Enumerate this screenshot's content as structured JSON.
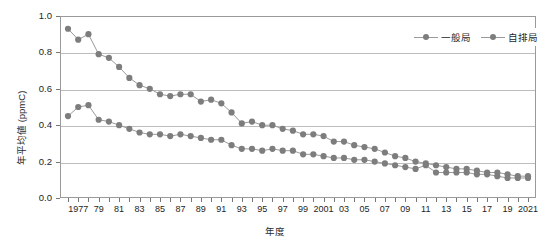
{
  "chart_data": {
    "type": "line",
    "title": "",
    "xlabel": "年度",
    "ylabel": "年平均値 (ppmC)",
    "ylim": [
      0.0,
      1.0
    ],
    "ytick_labels": [
      "0.0",
      "0.2",
      "0.4",
      "0.6",
      "0.8",
      "1.0"
    ],
    "ytick_values": [
      0.0,
      0.2,
      0.4,
      0.6,
      0.8,
      1.0
    ],
    "grid": true,
    "legend_position": "top-right",
    "x": [
      1976,
      1977,
      1978,
      1979,
      1980,
      1981,
      1982,
      1983,
      1984,
      1985,
      1986,
      1987,
      1988,
      1989,
      1990,
      1991,
      1992,
      1993,
      1994,
      1995,
      1996,
      1997,
      1998,
      1999,
      2000,
      2001,
      2002,
      2003,
      2004,
      2005,
      2006,
      2007,
      2008,
      2009,
      2010,
      2011,
      2012,
      2013,
      2014,
      2015,
      2016,
      2017,
      2018,
      2019,
      2020,
      2021
    ],
    "xtick_labels": [
      "1977",
      "79",
      "81",
      "83",
      "85",
      "87",
      "89",
      "91",
      "93",
      "95",
      "97",
      "99",
      "2001",
      "03",
      "05",
      "07",
      "09",
      "11",
      "13",
      "15",
      "17",
      "19",
      "2021"
    ],
    "xtick_values": [
      1977,
      1979,
      1981,
      1983,
      1985,
      1987,
      1989,
      1991,
      1993,
      1995,
      1997,
      1999,
      2001,
      2003,
      2005,
      2007,
      2009,
      2011,
      2013,
      2015,
      2017,
      2019,
      2021
    ],
    "series": [
      {
        "name": "一般局",
        "color": "#7d7d7d",
        "values": [
          0.45,
          0.5,
          0.51,
          0.43,
          0.42,
          0.4,
          0.38,
          0.36,
          0.35,
          0.35,
          0.34,
          0.35,
          0.34,
          0.33,
          0.32,
          0.32,
          0.29,
          0.27,
          0.27,
          0.26,
          0.27,
          0.26,
          0.26,
          0.24,
          0.24,
          0.23,
          0.22,
          0.22,
          0.21,
          0.21,
          0.2,
          0.19,
          0.18,
          0.17,
          0.16,
          0.18,
          0.14,
          0.14,
          0.14,
          0.14,
          0.13,
          0.13,
          0.12,
          0.11,
          0.11,
          0.11
        ]
      },
      {
        "name": "自排局",
        "color": "#7d7d7d",
        "values": [
          0.93,
          0.87,
          0.9,
          0.79,
          0.77,
          0.72,
          0.66,
          0.62,
          0.6,
          0.57,
          0.56,
          0.57,
          0.57,
          0.53,
          0.54,
          0.52,
          0.47,
          0.41,
          0.42,
          0.4,
          0.4,
          0.38,
          0.37,
          0.35,
          0.35,
          0.34,
          0.31,
          0.31,
          0.29,
          0.28,
          0.27,
          0.25,
          0.23,
          0.22,
          0.2,
          0.19,
          0.18,
          0.17,
          0.16,
          0.16,
          0.15,
          0.14,
          0.14,
          0.13,
          0.12,
          0.12
        ]
      }
    ]
  },
  "legend": {
    "entries": [
      {
        "label": "一般局"
      },
      {
        "label": "自排局"
      }
    ]
  }
}
